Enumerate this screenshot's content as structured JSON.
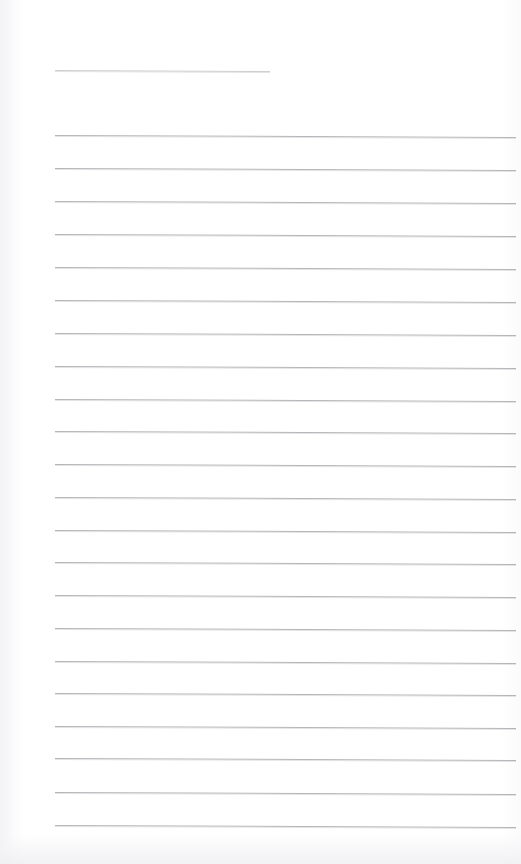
{
  "document": {
    "type": "lined-notebook-page",
    "title_text": "",
    "body_text": "",
    "page_width": 521,
    "page_height": 864,
    "background_color": "#fefefe",
    "rule_color": "#b6b6ba",
    "title_rule_color": "#cfcfd3"
  },
  "layout": {
    "margin_left": 55,
    "margin_right": 516,
    "title_rule": {
      "y": 70,
      "x_start": 55,
      "x_end": 270,
      "slant_px": 1
    },
    "body_rules": {
      "first_y": 135,
      "spacing": 33,
      "count": 22,
      "x_start": 55,
      "x_end": 516,
      "slant_px": 2
    }
  },
  "rules": [
    {
      "name": "title-rule",
      "y": 70,
      "x": 55,
      "width": 215,
      "slant": 1,
      "kind": "title"
    },
    {
      "name": "rule-1",
      "y": 135,
      "x": 55,
      "width": 461,
      "slant": 2.0,
      "kind": "body"
    },
    {
      "name": "rule-2",
      "y": 168,
      "x": 55,
      "width": 461,
      "slant": 2.0,
      "kind": "body"
    },
    {
      "name": "rule-3",
      "y": 201,
      "x": 55,
      "width": 461,
      "slant": 2.0,
      "kind": "body"
    },
    {
      "name": "rule-4",
      "y": 234,
      "x": 55,
      "width": 461,
      "slant": 2.0,
      "kind": "body"
    },
    {
      "name": "rule-5",
      "y": 267,
      "x": 55,
      "width": 461,
      "slant": 2.0,
      "kind": "body"
    },
    {
      "name": "rule-6",
      "y": 300,
      "x": 55,
      "width": 461,
      "slant": 2.0,
      "kind": "body"
    },
    {
      "name": "rule-7",
      "y": 333,
      "x": 55,
      "width": 461,
      "slant": 2.0,
      "kind": "body"
    },
    {
      "name": "rule-8",
      "y": 366,
      "x": 55,
      "width": 461,
      "slant": 2.0,
      "kind": "body"
    },
    {
      "name": "rule-9",
      "y": 399,
      "x": 55,
      "width": 461,
      "slant": 2.0,
      "kind": "body"
    },
    {
      "name": "rule-10",
      "y": 431,
      "x": 55,
      "width": 461,
      "slant": 2.0,
      "kind": "body"
    },
    {
      "name": "rule-11",
      "y": 464,
      "x": 55,
      "width": 461,
      "slant": 2.0,
      "kind": "body"
    },
    {
      "name": "rule-12",
      "y": 497,
      "x": 55,
      "width": 461,
      "slant": 2.0,
      "kind": "body"
    },
    {
      "name": "rule-13",
      "y": 530,
      "x": 55,
      "width": 461,
      "slant": 2.0,
      "kind": "body"
    },
    {
      "name": "rule-14",
      "y": 562,
      "x": 55,
      "width": 461,
      "slant": 2.0,
      "kind": "body"
    },
    {
      "name": "rule-15",
      "y": 595,
      "x": 55,
      "width": 461,
      "slant": 2.0,
      "kind": "body"
    },
    {
      "name": "rule-16",
      "y": 628,
      "x": 55,
      "width": 461,
      "slant": 2.0,
      "kind": "body"
    },
    {
      "name": "rule-17",
      "y": 661,
      "x": 55,
      "width": 461,
      "slant": 2.0,
      "kind": "body"
    },
    {
      "name": "rule-18",
      "y": 693,
      "x": 55,
      "width": 461,
      "slant": 2.0,
      "kind": "body"
    },
    {
      "name": "rule-19",
      "y": 726,
      "x": 55,
      "width": 461,
      "slant": 2.0,
      "kind": "body"
    },
    {
      "name": "rule-20",
      "y": 758,
      "x": 55,
      "width": 461,
      "slant": 2.0,
      "kind": "body"
    },
    {
      "name": "rule-21",
      "y": 792,
      "x": 55,
      "width": 461,
      "slant": 2.0,
      "kind": "body"
    },
    {
      "name": "rule-22",
      "y": 825,
      "x": 55,
      "width": 461,
      "slant": 2.0,
      "kind": "body"
    }
  ]
}
